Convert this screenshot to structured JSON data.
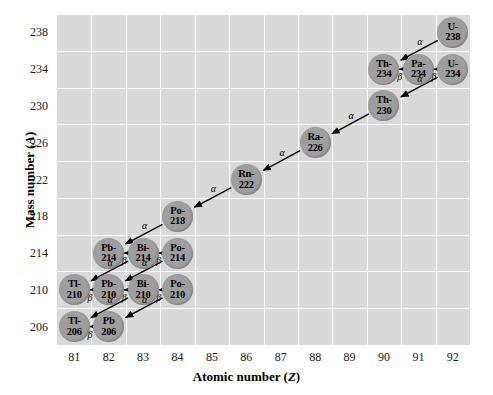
{
  "chart_data": {
    "type": "scatter",
    "title": "",
    "xlabel": "Atomic number (Z)",
    "ylabel": "Mass number (A)",
    "xlim": [
      80.5,
      92.5
    ],
    "ylim": [
      204,
      240
    ],
    "xticks": [
      81,
      82,
      83,
      84,
      85,
      86,
      87,
      88,
      89,
      90,
      91,
      92
    ],
    "yticks": [
      206,
      210,
      214,
      218,
      222,
      226,
      230,
      234,
      238
    ],
    "grid": true,
    "legend": "none",
    "nodes": [
      {
        "id": "U-238",
        "label_top": "U-",
        "label_bot": "238",
        "z": 92,
        "a": 238
      },
      {
        "id": "Th-234",
        "label_top": "Th-",
        "label_bot": "234",
        "z": 90,
        "a": 234
      },
      {
        "id": "Pa-234",
        "label_top": "Pa-",
        "label_bot": "234",
        "z": 91,
        "a": 234
      },
      {
        "id": "U-234",
        "label_top": "U-",
        "label_bot": "234",
        "z": 92,
        "a": 234
      },
      {
        "id": "Th-230",
        "label_top": "Th-",
        "label_bot": "230",
        "z": 90,
        "a": 230
      },
      {
        "id": "Ra-226",
        "label_top": "Ra-",
        "label_bot": "226",
        "z": 88,
        "a": 226
      },
      {
        "id": "Rn-222",
        "label_top": "Rn-",
        "label_bot": "222",
        "z": 86,
        "a": 222
      },
      {
        "id": "Po-218",
        "label_top": "Po-",
        "label_bot": "218",
        "z": 84,
        "a": 218
      },
      {
        "id": "Pb-214",
        "label_top": "Pb-",
        "label_bot": "214",
        "z": 82,
        "a": 214
      },
      {
        "id": "Bi-214",
        "label_top": "Bi-",
        "label_bot": "214",
        "z": 83,
        "a": 214
      },
      {
        "id": "Po-214",
        "label_top": "Po-",
        "label_bot": "214",
        "z": 84,
        "a": 214
      },
      {
        "id": "Tl-210",
        "label_top": "Tl-",
        "label_bot": "210",
        "z": 81,
        "a": 210
      },
      {
        "id": "Pb-210",
        "label_top": "Pb-",
        "label_bot": "210",
        "z": 82,
        "a": 210
      },
      {
        "id": "Bi-210",
        "label_top": "Bi-",
        "label_bot": "210",
        "z": 83,
        "a": 210
      },
      {
        "id": "Po-210",
        "label_top": "Po-",
        "label_bot": "210",
        "z": 84,
        "a": 210
      },
      {
        "id": "Tl-206",
        "label_top": "Tl-",
        "label_bot": "206",
        "z": 81,
        "a": 206
      },
      {
        "id": "Pb-206",
        "label_top": "Pb",
        "label_bot": "206",
        "z": 82,
        "a": 206
      }
    ],
    "decays": [
      {
        "from": "U-238",
        "to": "Th-234",
        "type": "alpha",
        "symbol": "α"
      },
      {
        "from": "Th-234",
        "to": "Pa-234",
        "type": "beta",
        "symbol": "β"
      },
      {
        "from": "Pa-234",
        "to": "U-234",
        "type": "beta",
        "symbol": "β"
      },
      {
        "from": "U-234",
        "to": "Th-230",
        "type": "alpha",
        "symbol": "α"
      },
      {
        "from": "Th-230",
        "to": "Ra-226",
        "type": "alpha",
        "symbol": "α"
      },
      {
        "from": "Ra-226",
        "to": "Rn-222",
        "type": "alpha",
        "symbol": "α"
      },
      {
        "from": "Rn-222",
        "to": "Po-218",
        "type": "alpha",
        "symbol": "α"
      },
      {
        "from": "Po-218",
        "to": "Pb-214",
        "type": "alpha",
        "symbol": "α"
      },
      {
        "from": "Pb-214",
        "to": "Bi-214",
        "type": "beta",
        "symbol": "β"
      },
      {
        "from": "Bi-214",
        "to": "Po-214",
        "type": "beta",
        "symbol": "β"
      },
      {
        "from": "Bi-214",
        "to": "Tl-210",
        "type": "alpha",
        "symbol": "α"
      },
      {
        "from": "Po-214",
        "to": "Pb-210",
        "type": "alpha",
        "symbol": "α"
      },
      {
        "from": "Tl-210",
        "to": "Pb-210",
        "type": "beta",
        "symbol": "β"
      },
      {
        "from": "Pb-210",
        "to": "Bi-210",
        "type": "beta",
        "symbol": "β"
      },
      {
        "from": "Bi-210",
        "to": "Po-210",
        "type": "beta",
        "symbol": "β"
      },
      {
        "from": "Bi-210",
        "to": "Tl-206",
        "type": "alpha",
        "symbol": "α"
      },
      {
        "from": "Po-210",
        "to": "Pb-206",
        "type": "alpha",
        "symbol": "α"
      },
      {
        "from": "Tl-206",
        "to": "Pb-206",
        "type": "beta",
        "symbol": "β"
      }
    ],
    "colors": {
      "plot_background": "#d9d9d9",
      "gridline": "#ffffff",
      "node_fill": "#9e9e9e",
      "arrow": "#000000",
      "text": "#000000"
    }
  }
}
